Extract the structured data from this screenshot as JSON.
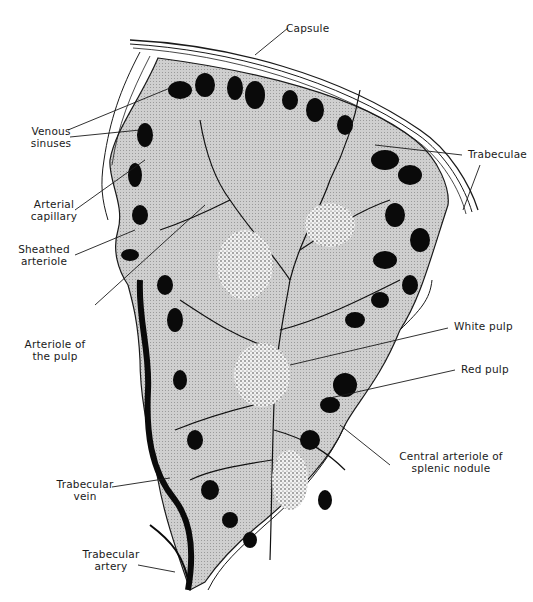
{
  "figure": {
    "colors": {
      "background": "#ffffff",
      "parenchyma": "#c9c9c9",
      "sinus": "#0a0a0a",
      "capsule_line": "#1a1a1a",
      "white_pulp_dots": "#2a2a2a"
    }
  },
  "labels": {
    "capsule": "Capsule",
    "venous_sinuses": [
      "Venous",
      "sinuses"
    ],
    "trabeculae": "Trabeculae",
    "arterial_capillary": [
      "Arterial",
      "capillary"
    ],
    "sheathed_arteriole": [
      "Sheathed",
      "arteriole"
    ],
    "arteriole_of_pulp": [
      "Arteriole of",
      "the pulp"
    ],
    "white_pulp": "White pulp",
    "red_pulp": "Red pulp",
    "central_arteriole": [
      "Central arteriole  of",
      "splenic nodule"
    ],
    "trabecular_vein": [
      "Trabecular",
      "vein"
    ],
    "trabecular_artery": [
      "Trabecular",
      "artery"
    ]
  }
}
